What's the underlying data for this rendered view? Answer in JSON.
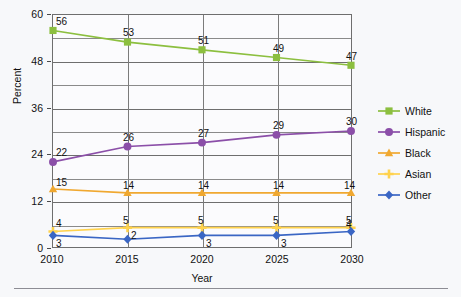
{
  "chart_data": {
    "type": "line",
    "title": "",
    "xlabel": "Year",
    "ylabel": "Percent",
    "categories": [
      "2010",
      "2015",
      "2020",
      "2025",
      "2030"
    ],
    "x": [
      2010,
      2015,
      2020,
      2025,
      2030
    ],
    "xlim": [
      2010,
      2030
    ],
    "ylim": [
      0,
      60
    ],
    "yticks": [
      0,
      12,
      24,
      36,
      48,
      60
    ],
    "yticklabels": [
      "0",
      "12",
      "24",
      "36",
      "48",
      "60"
    ],
    "minor_gridlines_y": [
      6,
      18,
      30,
      42,
      54
    ],
    "grid": true,
    "legend_position": "right",
    "data_labels": true,
    "series": [
      {
        "name": "White",
        "color": "#8CBF3F",
        "marker": "square",
        "values": [
          56,
          53,
          51,
          49,
          47
        ],
        "labels": [
          "56",
          "53",
          "51",
          "49",
          "47"
        ]
      },
      {
        "name": "Hispanic",
        "color": "#8B4FA8",
        "marker": "circle",
        "values": [
          22,
          26,
          27,
          29,
          30
        ],
        "labels": [
          "22",
          "26",
          "27",
          "29",
          "30"
        ]
      },
      {
        "name": "Black",
        "color": "#F0A830",
        "marker": "triangle",
        "values": [
          15,
          14,
          14,
          14,
          14
        ],
        "labels": [
          "15",
          "14",
          "14",
          "14",
          "14"
        ]
      },
      {
        "name": "Asian",
        "color": "#FFD24D",
        "marker": "plus",
        "values": [
          4,
          5,
          5,
          5,
          5
        ],
        "labels": [
          "4",
          "5",
          "5",
          "5",
          "5"
        ]
      },
      {
        "name": "Other",
        "color": "#3A66C4",
        "marker": "diamond",
        "values": [
          3,
          2,
          3,
          3,
          4
        ],
        "labels": [
          "3",
          "2",
          "3",
          "3",
          "4"
        ]
      }
    ]
  },
  "legend": {
    "items": [
      {
        "label": "White"
      },
      {
        "label": "Hispanic"
      },
      {
        "label": "Black"
      },
      {
        "label": "Asian"
      },
      {
        "label": "Other"
      }
    ]
  }
}
